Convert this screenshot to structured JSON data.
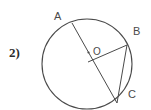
{
  "figure": {
    "problem_number": "2)",
    "background_color": "#ffffff",
    "stroke_color": "#4a4a4a",
    "label_color": "#4a4a4a",
    "number_color": "#2b2b2b",
    "circle": {
      "center_x": 87,
      "center_y": 64,
      "radius": 45,
      "stroke_width": 1.1
    },
    "center_point": {
      "label": "O",
      "dot_x": 88.5,
      "dot_y": 52.5,
      "dot_radius": 1.1,
      "label_x": 93,
      "label_y": 55
    },
    "points": [
      {
        "name": "A",
        "label": "A",
        "x": 72,
        "y": 23,
        "label_x": 54,
        "label_y": 20
      },
      {
        "name": "B",
        "label": "B",
        "x": 127,
        "y": 45,
        "label_x": 133,
        "label_y": 35
      },
      {
        "name": "C",
        "label": "C",
        "x": 117,
        "y": 103,
        "label_x": 128,
        "label_y": 98
      }
    ],
    "segments": [
      {
        "name": "chord-a-c",
        "from": "A",
        "to": "C",
        "x1": 72,
        "y1": 23,
        "x2": 117,
        "y2": 103
      },
      {
        "name": "radius-o-b",
        "from": "O",
        "to": "B",
        "x1": 88,
        "y1": 62,
        "x2": 127,
        "y2": 45
      },
      {
        "name": "chord-b-c",
        "from": "B",
        "to": "C",
        "x1": 127,
        "y1": 45,
        "x2": 117,
        "y2": 103
      }
    ]
  }
}
